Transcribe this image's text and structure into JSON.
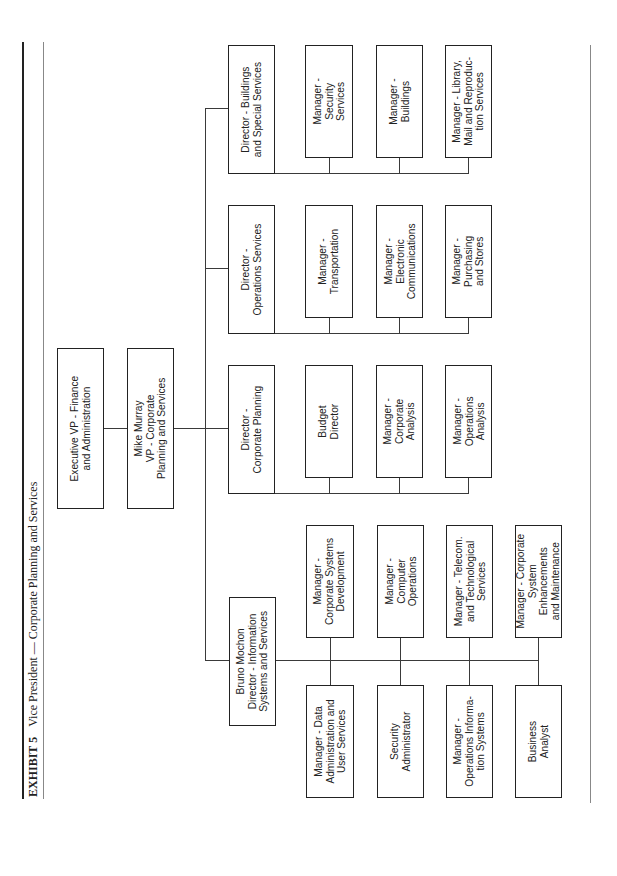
{
  "exhibit": {
    "label": "EXHIBIT 5",
    "title": "Vice President — Corporate Planning and Services"
  },
  "top": {
    "exec_vp": "Executive VP - Finance\nand Administration",
    "vp": "Mike Murray\nVP - Corporate\nPlanning and Services"
  },
  "directors": {
    "buildings": "Director - Buildings\nand Special Services",
    "operations": "Director -\nOperations Services",
    "planning": "Director -\nCorporate Planning",
    "info_systems": "Bruno Mochon\nDirector - Information\nSystems and Services"
  },
  "buildings_reports": [
    "Manager -\nSecurity\nServices",
    "Manager -\nBuildings",
    "Manager - Library,\nMail and Reproduc-\ntion Services"
  ],
  "operations_reports": [
    "Manager -\nTransportation",
    "Manager -\nElectronic\nCommunications",
    "Manager -\nPurchasing\nand Stores"
  ],
  "planning_reports": [
    "Budget\nDirector",
    "Manager -\nCorporate\nAnalysis",
    "Manager -\nOperations\nAnalysis"
  ],
  "info_systems_reports_upper": [
    "Manager -\nCorporate Systems\nDevelopment",
    "Manager -\nComputer\nOperations",
    "Manager - Telecom.\nand Technological\nServices",
    "Manager - Corporate\nSystem\nEnhancements\nand Maintenance"
  ],
  "info_systems_reports_lower": [
    "Manager - Data\nAdministration and\nUser Services",
    "Security\nAdministrator",
    "Manager -\nOperations Informa-\ntion Systems",
    "Business\nAnalyst"
  ]
}
